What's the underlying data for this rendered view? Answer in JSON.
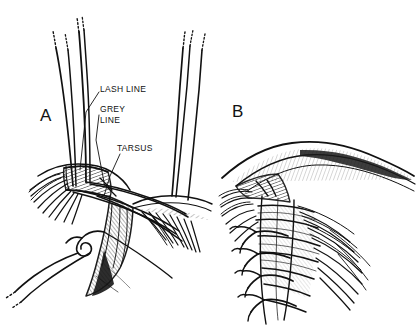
{
  "figure": {
    "background_color": "#ffffff",
    "ink_color": "#111111",
    "width": 417,
    "height": 336
  },
  "panels": [
    {
      "letter": "A",
      "caption": "Eyelid margin laceration with three interrupted margin sutures placed and untied"
    },
    {
      "letter": "B",
      "caption": "Eyelid margin after sutures are tied, with tails secured away from the globe"
    }
  ],
  "labels": [
    {
      "id": "lash",
      "text": "LASH LINE"
    },
    {
      "id": "grey1",
      "text": "GREY"
    },
    {
      "id": "grey2",
      "text": "LINE"
    },
    {
      "id": "tarsus",
      "text": "TARSUS"
    }
  ],
  "icons": {
    "suture_strand": "suture-strand-icon",
    "suture_knot": "suture-knot-icon",
    "eyelash_fringe": "eyelash-fringe-icon",
    "tarsal_plate": "tarsal-plate-icon"
  }
}
